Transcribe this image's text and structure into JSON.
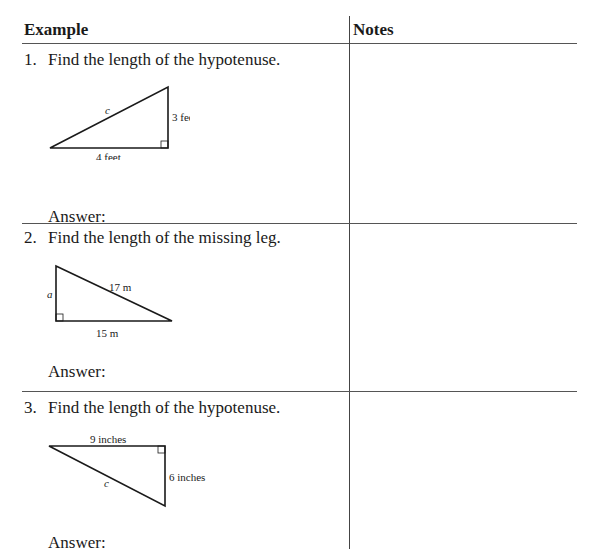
{
  "table": {
    "headers": {
      "example": "Example",
      "notes": "Notes"
    },
    "rows": [
      {
        "number": "1.",
        "question": "Find the length of the hypotenuse.",
        "figure": {
          "hypotenuse": "c",
          "vertical_leg": "3 feet",
          "horizontal_leg": "4 feet"
        },
        "answer_label": "Answer:"
      },
      {
        "number": "2.",
        "question": "Find the length of the missing leg.",
        "figure": {
          "vertical_leg": "a",
          "hypotenuse": "17 m",
          "horizontal_leg": "15 m"
        },
        "answer_label": "Answer:"
      },
      {
        "number": "3.",
        "question": "Find the length of the hypotenuse.",
        "figure": {
          "horizontal_leg": "9 inches",
          "vertical_leg": "6 inches",
          "hypotenuse": "c"
        },
        "answer_label": "Answer:"
      }
    ]
  }
}
